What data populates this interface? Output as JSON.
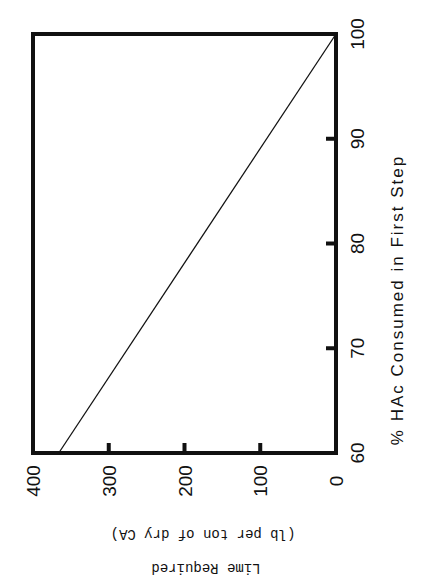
{
  "chart_data": {
    "type": "line",
    "title": "",
    "xlabel": "% HAc Consumed in First Step",
    "ylabel": "Lime Required",
    "ylabel_sub": "(lb per ton of dry CA)",
    "xlim": [
      60,
      100
    ],
    "ylim": [
      0,
      400
    ],
    "x_ticks": [
      "60",
      "70",
      "80",
      "90",
      "100"
    ],
    "y_ticks": [
      "0",
      "100",
      "200",
      "300",
      "400"
    ],
    "grid": false,
    "legend": null,
    "orientation": "rotated 90 degrees clockwise",
    "series": [
      {
        "name": "Lime Required",
        "x": [
          60,
          100
        ],
        "values": [
          366,
          0
        ]
      }
    ]
  }
}
